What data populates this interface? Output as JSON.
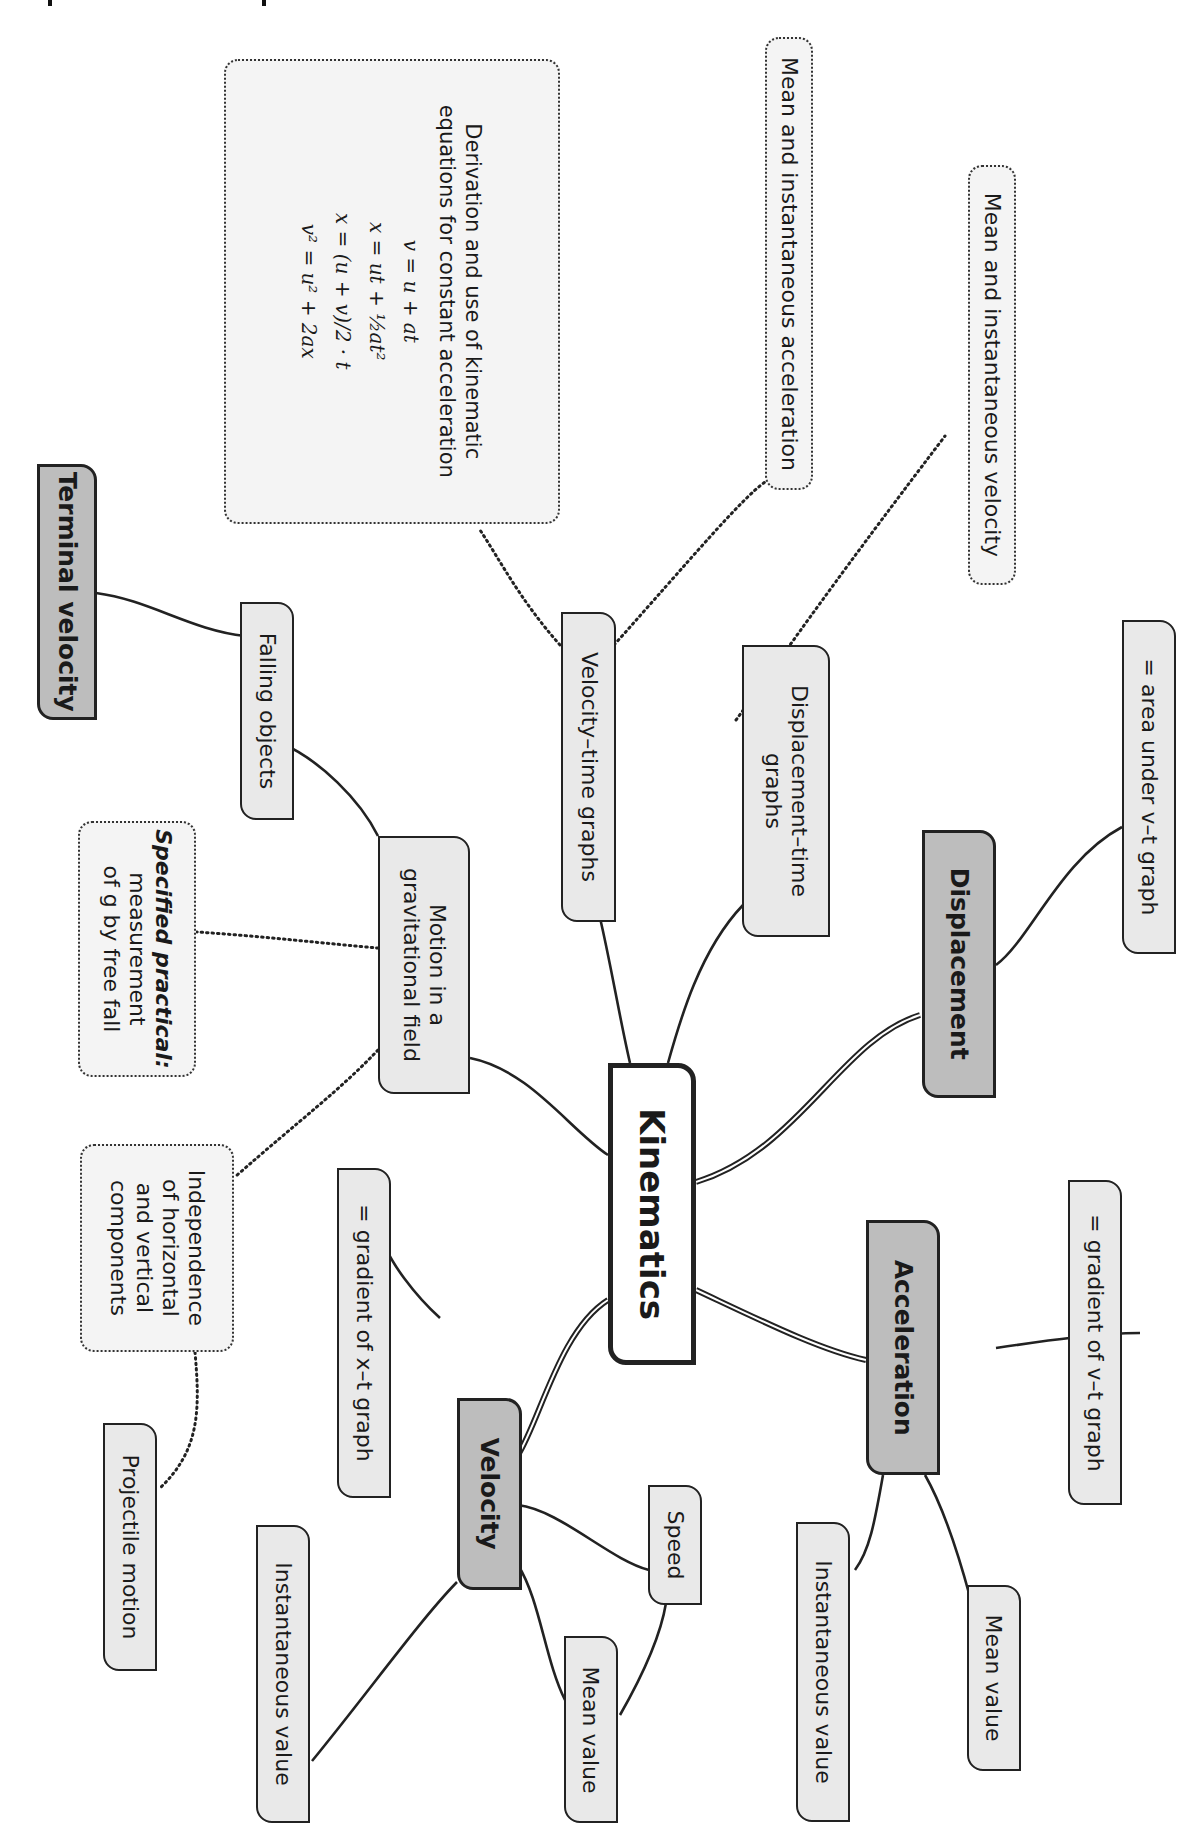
{
  "diagram": {
    "type": "mind-map",
    "orientation": "rotated-90-clockwise",
    "colors": {
      "root_fill": "#ffffff",
      "main_branch_fill": "#bdbdbd",
      "sub_node_fill": "#e9e9e9",
      "note_fill": "#f4f4f4",
      "stroke": "#222222"
    },
    "root": {
      "label": "Kinematics"
    },
    "branches": {
      "displacement": {
        "label": "Displacement"
      },
      "acceleration": {
        "label": "Acceleration"
      },
      "velocity": {
        "label": "Velocity"
      },
      "motion_grav": {
        "label_line1": "Motion in a",
        "label_line2": "gravitational field"
      },
      "vt_graphs": {
        "label": "Velocity–time graphs"
      },
      "xt_graphs": {
        "label_line1": "Displacement–time",
        "label_line2": "graphs"
      }
    },
    "leaves": {
      "area_under_vt": "= area under v–t graph",
      "gradient_vt": "= gradient of v–t graph",
      "accel_instantaneous": "Instantaneous value",
      "accel_mean": "Mean value",
      "gradient_xt": "= gradient of x–t graph",
      "speed": "Speed",
      "vel_instantaneous": "Instantaneous value",
      "vel_mean": "Mean value",
      "falling_objects": "Falling objects",
      "terminal_velocity": "Terminal velocity",
      "projectile_motion": "Projectile motion"
    },
    "notes": {
      "mean_inst_velocity": "Mean and instantaneous velocity",
      "mean_inst_acceleration": "Mean and instantaneous acceleration",
      "kinematic_equations": {
        "title_line1": "Derivation and use of kinematic",
        "title_line2": "equations for constant acceleration",
        "equations": [
          "v = u + at",
          "x = ut + ½at²",
          "x = (u + v)/2 · t",
          "v² = u² + 2ax"
        ]
      },
      "specified_practical": {
        "emphasis": "Specified practical:",
        "line2": "measurement",
        "line3": "of g by free fall"
      },
      "independence": {
        "line1": "Independence",
        "line2": "of horizontal",
        "line3": "and vertical",
        "line4": "components"
      }
    }
  }
}
